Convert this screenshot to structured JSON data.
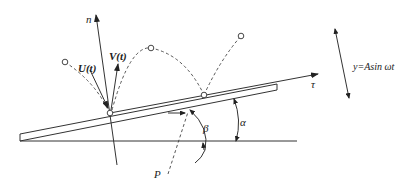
{
  "diagram": {
    "labels": {
      "normal_axis": "n",
      "tangent_axis": "τ",
      "velocity_out": "V(t)",
      "velocity_in": "U(t)",
      "incline_angle": "α",
      "angle_beta": "β",
      "point": "P",
      "vibration": "y=Asin ωt"
    }
  }
}
